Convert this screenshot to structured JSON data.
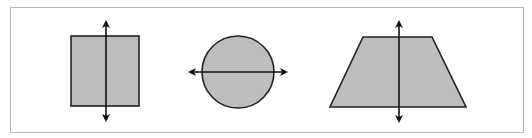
{
  "diagram": {
    "title": "",
    "colors": {
      "frame": "#b8b8b8",
      "shape_fill": "#bdbdbd",
      "stroke": "#111111",
      "background": "#ffffff"
    },
    "shapes": [
      {
        "name": "square",
        "fill": "#bdbdbd",
        "rect": {
          "x": 71,
          "y": 36,
          "w": 68,
          "h": 70
        },
        "symmetry_axis": {
          "orientation": "vertical",
          "x1": 106,
          "y1": 22,
          "x2": 106,
          "y2": 120
        }
      },
      {
        "name": "circle",
        "fill": "#bdbdbd",
        "circle": {
          "cx": 238,
          "cy": 72,
          "r": 36
        },
        "symmetry_axis": {
          "orientation": "horizontal",
          "x1": 190,
          "y1": 72,
          "x2": 286,
          "y2": 72
        }
      },
      {
        "name": "trapezoid",
        "fill": "#bdbdbd",
        "points": "363,37 432,37 466,107 330,107",
        "symmetry_axis": {
          "orientation": "vertical",
          "x1": 399,
          "y1": 22,
          "x2": 399,
          "y2": 121
        }
      }
    ]
  }
}
